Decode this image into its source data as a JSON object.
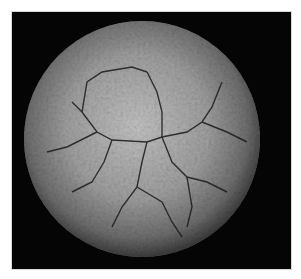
{
  "image": {
    "description": "3D surface rendering of a spherical virus capsid on black background",
    "alt": "Virus capsid surface rendering",
    "colors": {
      "background": "#050505",
      "border": "#ffffff",
      "surface_light": "#c8c8c8",
      "surface_mid": "#8a8a8a",
      "surface_dark": "#3a3a3a",
      "crack": "#1a1a1a"
    }
  }
}
